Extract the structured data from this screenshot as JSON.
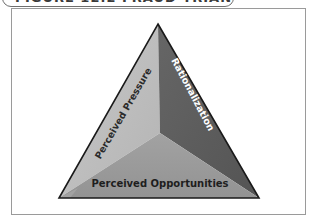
{
  "figure": {
    "title": "FIGURE 12.2 FRAUD TRIANGLE"
  },
  "diagram": {
    "type": "pyramid-triangle",
    "faces": [
      {
        "id": "left",
        "label": "Perceived Pressure",
        "color": "#bcbcbc",
        "text_color": "#2a2a2a"
      },
      {
        "id": "right",
        "label": "Rationalization",
        "color": "#5c5c5c",
        "text_color": "#ffffff"
      },
      {
        "id": "bottom",
        "label": "Perceived Opportunities",
        "color": "#9b9b9b",
        "text_color": "#1e1e1e"
      }
    ],
    "outline_color": "#1a1a1a",
    "frame_color": "#9a9a9a"
  }
}
